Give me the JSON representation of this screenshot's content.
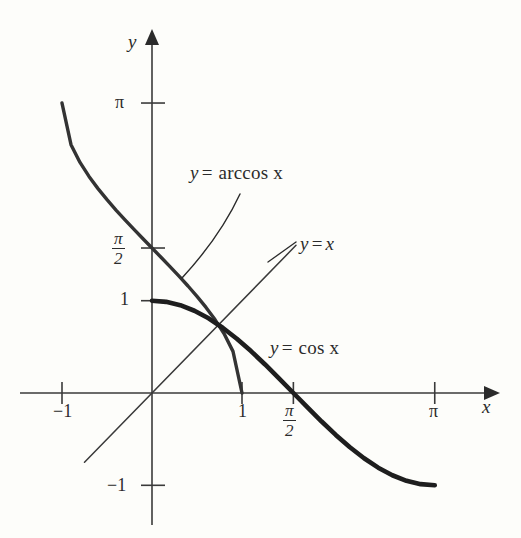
{
  "figure": {
    "kind": "mathematical-graph",
    "background_color": "#fdfdfa",
    "ink_color": "#2b2b2b",
    "axis_color": "#3a3a3a"
  },
  "axes": {
    "x_axis_label": "x",
    "y_axis_label": "y",
    "origin_px": [
      152,
      393
    ],
    "x_scale_px_per_unit": 90,
    "y_scale_px_per_unit": 92.3,
    "x_ticks": [
      {
        "label": "−1",
        "value": -1
      },
      {
        "label": "1",
        "value": 1
      },
      {
        "label_num": "π",
        "label_den": "2",
        "value": 1.5708,
        "fraction": true
      },
      {
        "label": "π",
        "value": 3.1416
      }
    ],
    "y_ticks": [
      {
        "label": "π",
        "value": 3.1416
      },
      {
        "label_num": "π",
        "label_den": "2",
        "value": 1.5708,
        "fraction": true
      },
      {
        "label": "1",
        "value": 1
      },
      {
        "label": "−1",
        "value": -1
      }
    ]
  },
  "labels": {
    "arccos": {
      "lhs": "y",
      "op": "=",
      "rhs": "arccos x"
    },
    "identity": {
      "lhs": "y",
      "op": "=",
      "rhs": "x"
    },
    "cos": {
      "lhs": "y",
      "op": "=",
      "rhs": "cos x"
    }
  },
  "chart_data": {
    "type": "line",
    "title": "",
    "xlabel": "x",
    "ylabel": "y",
    "xlim": [
      -1.2,
      3.75
    ],
    "ylim": [
      -1.5,
      3.6
    ],
    "grid": false,
    "legend": "inline-annotations",
    "x_tick_labels": [
      "−1",
      "1",
      "π/2",
      "π"
    ],
    "x_tick_values": [
      -1,
      1,
      1.5708,
      3.1416
    ],
    "y_tick_labels": [
      "π",
      "π/2",
      "1",
      "−1"
    ],
    "y_tick_values": [
      3.1416,
      1.5708,
      1,
      -1
    ],
    "series": [
      {
        "name": "y = arccos x",
        "style": "solid",
        "line_width_px": 3.4,
        "color": "#333333",
        "domain": [
          -1,
          1
        ],
        "range": [
          0,
          3.1416
        ],
        "x": [
          -1,
          -0.9,
          -0.8,
          -0.7,
          -0.6,
          -0.5,
          -0.4,
          -0.3,
          -0.2,
          -0.1,
          0,
          0.1,
          0.2,
          0.3,
          0.4,
          0.5,
          0.6,
          0.7,
          0.8,
          0.9,
          1
        ],
        "y": [
          3.1416,
          2.6906,
          2.4981,
          2.3462,
          2.2143,
          2.0944,
          1.9823,
          1.8755,
          1.7722,
          1.671,
          1.5708,
          1.4706,
          1.3694,
          1.2661,
          1.1593,
          1.0472,
          0.9273,
          0.7954,
          0.6435,
          0.451,
          0
        ]
      },
      {
        "name": "y = cos x",
        "style": "solid",
        "line_width_px": 4.6,
        "color": "#1e1e1e",
        "domain": [
          0,
          3.1416
        ],
        "range": [
          -1,
          1
        ],
        "x": [
          0,
          0.1571,
          0.3142,
          0.4712,
          0.6283,
          0.7854,
          0.9425,
          1.0996,
          1.2566,
          1.4137,
          1.5708,
          1.7279,
          1.885,
          2.042,
          2.1991,
          2.3562,
          2.5133,
          2.6704,
          2.8274,
          2.9845,
          3.1416
        ],
        "y": [
          1,
          0.9877,
          0.9511,
          0.891,
          0.809,
          0.7071,
          0.5878,
          0.454,
          0.309,
          0.1564,
          0,
          -0.1564,
          -0.309,
          -0.454,
          -0.5878,
          -0.7071,
          -0.809,
          -0.891,
          -0.9511,
          -0.9877,
          -1
        ]
      },
      {
        "name": "y = x",
        "style": "solid",
        "line_width_px": 1.5,
        "color": "#3a3a3a",
        "domain": [
          -0.75,
          1.6
        ],
        "x": [
          -0.75,
          1.6
        ],
        "y": [
          -0.75,
          1.6
        ]
      }
    ],
    "annotations": [
      {
        "text": "y = arccos x",
        "x": 0.42,
        "y": 1.95,
        "leader": true
      },
      {
        "text": "y = x",
        "x": 1.68,
        "y": 1.62,
        "leader": true
      },
      {
        "text": "y = cos x",
        "x": 1.32,
        "y": 0.62,
        "leader": false
      }
    ],
    "intersection_note": {
      "description": "cos x, arccos x and y = x meet near x ≈ 0.739",
      "x": 0.739,
      "y": 0.739
    }
  }
}
